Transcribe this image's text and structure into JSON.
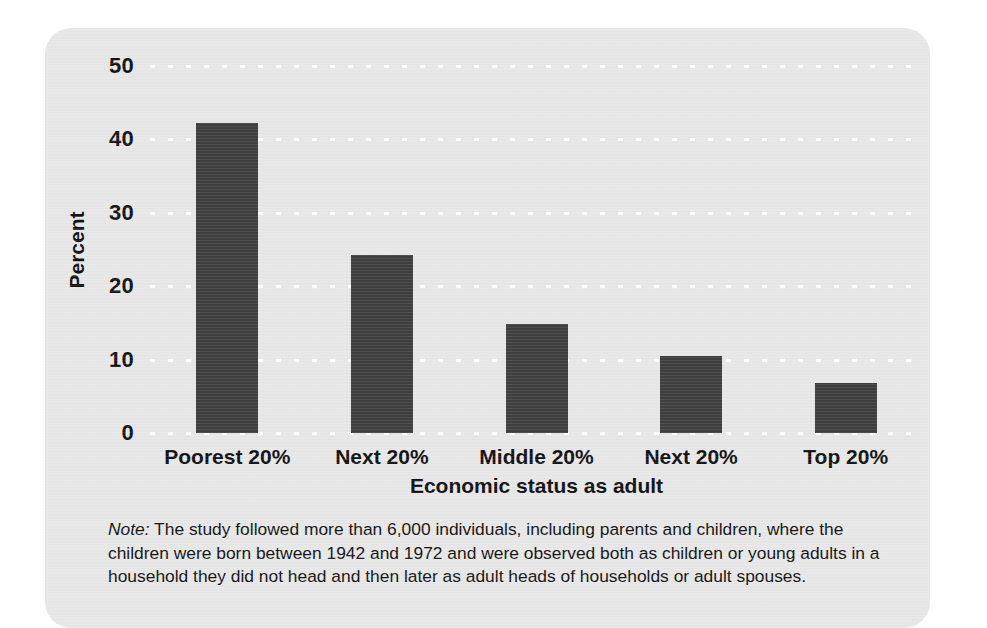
{
  "chart_data": {
    "type": "bar",
    "title": "",
    "xlabel": "Economic status as adult",
    "ylabel": "Percent",
    "categories": [
      "Poorest 20%",
      "Next 20%",
      "Middle 20%",
      "Next 20%",
      "Top 20%"
    ],
    "values": [
      42.3,
      24.3,
      14.8,
      10.5,
      6.8
    ],
    "ylim": [
      0,
      50
    ],
    "yticks": [
      0,
      10,
      20,
      30,
      40,
      50
    ],
    "ytick_labels": [
      "0",
      "10",
      "20",
      "30",
      "40",
      "50"
    ],
    "grid": true,
    "legend": "none",
    "bar_color": "#3f3f3f",
    "panel_color": "#e7e7e7",
    "grid_color": "#ffffff"
  },
  "note": {
    "label": "Note:",
    "lines": [
      " The study followed more than 6,000 individuals, including parents and children, where",
      "the children were born between 1942 and 1972 and were observed both as children or young",
      "adults in a household they did not head and then later as adult heads of households or adult",
      "spouses."
    ]
  }
}
